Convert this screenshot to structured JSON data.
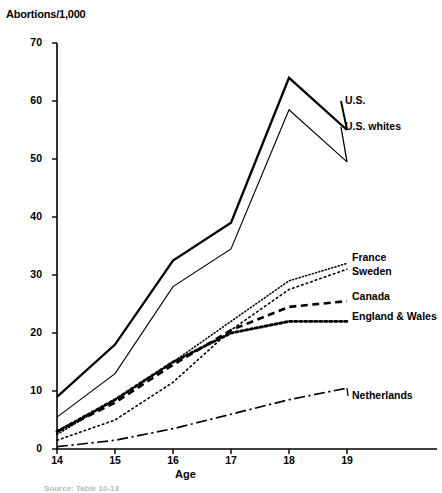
{
  "chart_data": {
    "type": "line",
    "title": "",
    "ylabel": "Abortions/1,000",
    "xlabel": "Age",
    "x": [
      14,
      15,
      16,
      17,
      18,
      19
    ],
    "xlim": [
      14,
      19
    ],
    "ylim": [
      0,
      70
    ],
    "yticks": [
      0,
      10,
      20,
      30,
      40,
      50,
      60,
      70
    ],
    "xticks": [
      14,
      15,
      16,
      17,
      18,
      19
    ],
    "grid": false,
    "legend_position": "right-inline-labels",
    "series": [
      {
        "name": "U.S.",
        "style": "solid-thick",
        "values": [
          9.0,
          18.0,
          32.5,
          39.0,
          64.0,
          55.0
        ]
      },
      {
        "name": "U.S. whites",
        "style": "solid-thin",
        "values": [
          5.5,
          13.0,
          28.0,
          34.5,
          58.5,
          49.5
        ]
      },
      {
        "name": "France",
        "style": "dotted-fine",
        "values": [
          2.5,
          8.5,
          15.0,
          22.0,
          29.0,
          32.0
        ]
      },
      {
        "name": "Sweden",
        "style": "dotted-sparse",
        "values": [
          1.5,
          5.0,
          11.5,
          20.5,
          27.5,
          31.0
        ]
      },
      {
        "name": "Canada",
        "style": "dashed",
        "values": [
          3.0,
          8.0,
          14.5,
          20.5,
          24.5,
          25.5
        ]
      },
      {
        "name": "England & Wales",
        "style": "dotted-thick",
        "values": [
          3.0,
          8.5,
          15.0,
          20.0,
          22.0,
          22.0
        ]
      },
      {
        "name": "Netherlands",
        "style": "dash-dot",
        "values": [
          0.4,
          1.5,
          3.5,
          6.0,
          8.5,
          10.5
        ]
      }
    ],
    "annotations": [
      {
        "text": "U.S.",
        "anchor_series": "U.S.",
        "x_px": 345,
        "y_px": 101
      },
      {
        "text": "U.S. whites",
        "anchor_series": "U.S. whites",
        "x_px": 345,
        "y_px": 127
      },
      {
        "text": "France",
        "anchor_series": "France",
        "x_px": 352,
        "y_px": 258
      },
      {
        "text": "Sweden",
        "anchor_series": "Sweden",
        "x_px": 352,
        "y_px": 272
      },
      {
        "text": "Canada",
        "anchor_series": "Canada",
        "x_px": 352,
        "y_px": 297
      },
      {
        "text": "England & Wales",
        "anchor_series": "England & Wales",
        "x_px": 352,
        "y_px": 317
      },
      {
        "text": "Netherlands",
        "anchor_series": "Netherlands",
        "x_px": 352,
        "y_px": 396
      }
    ],
    "source_note": "Source: Table 10-13"
  },
  "axis": {
    "y_title": "Abortions/1,000",
    "x_title": "Age",
    "y_tick_labels": [
      "70",
      "60",
      "50",
      "40",
      "30",
      "20",
      "10",
      "0"
    ],
    "x_tick_labels": [
      "14",
      "15",
      "16",
      "17",
      "18",
      "19"
    ]
  },
  "labels": {
    "us": "U.S.",
    "us_whites": "U.S. whites",
    "france": "France",
    "sweden": "Sweden",
    "canada": "Canada",
    "england_wales": "England & Wales",
    "netherlands": "Netherlands"
  },
  "colors": {
    "line": "#000000",
    "background": "#ffffff",
    "text": "#000000"
  },
  "source_note": "Source: Table 10-13"
}
